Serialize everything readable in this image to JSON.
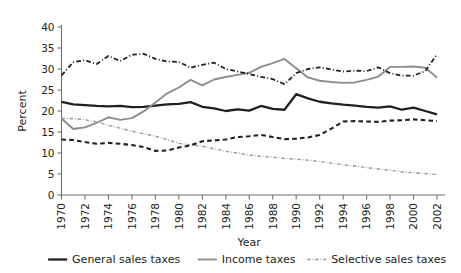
{
  "chart_data": {
    "type": "line",
    "title": "",
    "xlabel": "Year",
    "ylabel": "Percent",
    "xlim": [
      1970,
      2002
    ],
    "ylim": [
      0,
      40
    ],
    "ytick_step": 5,
    "xtick_step": 2,
    "grid": false,
    "legend_position": "bottom",
    "yticks": [
      0,
      5,
      10,
      15,
      20,
      25,
      30,
      35,
      40
    ],
    "xticks": [
      1970,
      1972,
      1974,
      1976,
      1978,
      1980,
      1982,
      1984,
      1986,
      1988,
      1990,
      1992,
      1994,
      1996,
      1998,
      2000,
      2002
    ],
    "x": [
      1970,
      1971,
      1972,
      1973,
      1974,
      1975,
      1976,
      1977,
      1978,
      1979,
      1980,
      1981,
      1982,
      1983,
      1984,
      1985,
      1986,
      1987,
      1988,
      1989,
      1990,
      1991,
      1992,
      1993,
      1994,
      1995,
      1996,
      1997,
      1998,
      1999,
      2000,
      2001,
      2002
    ],
    "series": [
      {
        "name": "General sales taxes",
        "style": "solid",
        "color": "#231f20",
        "width": 2.3,
        "values": [
          22.2,
          21.6,
          21.4,
          21.2,
          21.1,
          21.2,
          20.9,
          21.0,
          21.3,
          21.6,
          21.7,
          22.1,
          21.0,
          20.6,
          20.0,
          20.4,
          20.1,
          21.2,
          20.5,
          20.3,
          24.0,
          23.0,
          22.2,
          21.8,
          21.5,
          21.3,
          21.0,
          20.8,
          21.1,
          20.3,
          20.8,
          20.0,
          19.2
        ]
      },
      {
        "name": "Income taxes",
        "style": "solid",
        "color": "#8d8d8d",
        "width": 1.9,
        "values": [
          18.2,
          15.7,
          16.1,
          17.2,
          18.5,
          17.9,
          18.3,
          19.9,
          22.0,
          24.2,
          25.6,
          27.4,
          26.1,
          27.5,
          28.1,
          28.6,
          29.1,
          30.5,
          31.4,
          32.4,
          30.2,
          28.0,
          27.2,
          26.9,
          26.7,
          26.8,
          27.4,
          28.2,
          30.5,
          30.5,
          30.6,
          30.3,
          28.0
        ]
      },
      {
        "name": "Selective sales taxes",
        "style": "dashdot",
        "color": "#9a9a9a",
        "width": 1.4,
        "values": [
          18.2,
          18.2,
          17.9,
          17.4,
          16.6,
          15.9,
          15.2,
          14.6,
          14.0,
          13.2,
          12.3,
          11.9,
          11.6,
          11.0,
          10.4,
          10.0,
          9.5,
          9.2,
          9.0,
          8.7,
          8.5,
          8.3,
          8.0,
          7.6,
          7.2,
          6.9,
          6.5,
          6.2,
          5.9,
          5.5,
          5.3,
          5.1,
          4.9
        ]
      },
      {
        "name": "",
        "style": "dashdot",
        "color": "#231f20",
        "width": 1.8,
        "values": [
          28.5,
          31.6,
          32.1,
          31.2,
          33.1,
          31.9,
          33.4,
          33.6,
          32.4,
          31.8,
          31.7,
          30.3,
          31.0,
          31.5,
          30.0,
          29.4,
          28.8,
          28.1,
          27.6,
          26.4,
          29.0,
          30.0,
          30.4,
          29.9,
          29.4,
          29.6,
          29.5,
          30.4,
          29.0,
          28.4,
          28.4,
          29.5,
          33.5
        ]
      },
      {
        "name": "",
        "style": "dashed",
        "color": "#231f20",
        "width": 2.1,
        "values": [
          13.2,
          13.1,
          12.6,
          12.2,
          12.4,
          12.2,
          11.9,
          11.4,
          10.5,
          10.6,
          11.3,
          11.8,
          12.8,
          13.0,
          13.2,
          13.8,
          14.0,
          14.3,
          13.8,
          13.3,
          13.4,
          13.7,
          14.3,
          15.8,
          17.5,
          17.6,
          17.5,
          17.4,
          17.7,
          17.8,
          18.0,
          17.8,
          17.6
        ]
      }
    ]
  },
  "legend": {
    "items": [
      {
        "label": "General sales taxes",
        "style": "solid",
        "color": "#231f20"
      },
      {
        "label": "Income taxes",
        "style": "solid",
        "color": "#8d8d8d"
      },
      {
        "label": "Selective sales taxes",
        "style": "dashdot",
        "color": "#9a9a9a"
      }
    ]
  }
}
